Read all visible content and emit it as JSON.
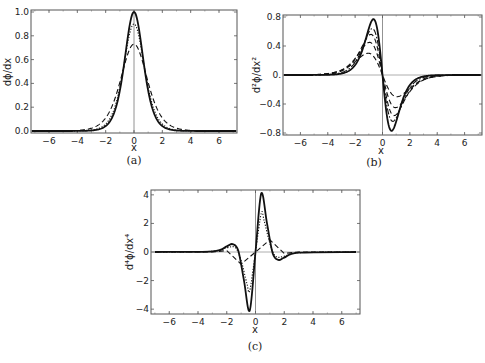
{
  "chart_data": [
    {
      "id": "a",
      "type": "line",
      "caption": "(a)",
      "xlabel": "x",
      "ylabel": "dϕ/dx",
      "xlim": [
        -7.2,
        7.2
      ],
      "ylim": [
        0,
        1.0
      ],
      "xticks": [
        "-6",
        "-4",
        "-2",
        "0",
        "2",
        "4",
        "6"
      ],
      "yticks": [
        "0.0",
        "0.2",
        "0.4",
        "0.6",
        "0.8",
        "1.0"
      ],
      "grid": false,
      "series": [
        {
          "name": "solid",
          "style": "solid",
          "peak": 1.0,
          "x": [
            -7,
            -3,
            -2,
            -1,
            -0.5,
            0,
            0.5,
            1,
            2,
            3,
            7
          ],
          "values": [
            0,
            0.01,
            0.07,
            0.42,
            0.79,
            1.0,
            0.79,
            0.42,
            0.07,
            0.01,
            0
          ]
        },
        {
          "name": "dotted",
          "style": "dotted",
          "peak": 0.9,
          "x": [
            -7,
            -3,
            -2,
            -1,
            -0.5,
            0,
            0.5,
            1,
            2,
            3,
            7
          ],
          "values": [
            0,
            0.01,
            0.08,
            0.43,
            0.74,
            0.9,
            0.74,
            0.43,
            0.08,
            0.01,
            0
          ]
        },
        {
          "name": "dashed",
          "style": "dashed",
          "peak": 0.73,
          "x": [
            -7,
            -3,
            -2,
            -1,
            0,
            1,
            2,
            3,
            7
          ],
          "values": [
            0,
            0.03,
            0.17,
            0.48,
            0.73,
            0.48,
            0.17,
            0.03,
            0
          ]
        }
      ]
    },
    {
      "id": "b",
      "type": "line",
      "caption": "(b)",
      "xlabel": "x",
      "ylabel": "d²ϕ/dx²",
      "xlim": [
        -7.2,
        7.2
      ],
      "ylim": [
        -0.8,
        0.8
      ],
      "xticks": [
        "-6",
        "-4",
        "-2",
        "0",
        "2",
        "4",
        "6"
      ],
      "yticks": [
        "-0.8",
        "-0.4",
        "0.",
        "0.4",
        "0.8"
      ],
      "grid": false,
      "series": [
        {
          "name": "solid",
          "style": "solid",
          "extremum": 0.77,
          "x_extremum": 0.66
        },
        {
          "name": "dot-dashed-1",
          "style": "dashdot",
          "extremum": 0.64,
          "x_extremum": 0.75
        },
        {
          "name": "dashed-1",
          "style": "dashed",
          "extremum": 0.56,
          "x_extremum": 0.85
        },
        {
          "name": "dashed-2",
          "style": "dashed",
          "extremum": 0.45,
          "x_extremum": 0.95
        },
        {
          "name": "dashed-3",
          "style": "dashed",
          "extremum": 0.3,
          "x_extremum": 1.05
        }
      ]
    },
    {
      "id": "c",
      "type": "line",
      "caption": "(c)",
      "xlabel": "x",
      "ylabel": "d⁴ϕ/dx⁴",
      "xlim": [
        -7.2,
        7.2
      ],
      "ylim": [
        -4.2,
        4.2
      ],
      "xticks": [
        "-6",
        "-4",
        "-2",
        "0",
        "2",
        "4",
        "6"
      ],
      "yticks": [
        "-4",
        "-2",
        "0",
        "2",
        "4"
      ],
      "grid": false,
      "series": [
        {
          "name": "solid",
          "style": "solid",
          "x": [
            -7,
            -3,
            -2,
            -1.6,
            -1.2,
            -0.8,
            -0.4,
            0,
            0.4,
            0.8,
            1.2,
            1.6,
            2,
            3,
            7
          ],
          "values": [
            0,
            0.05,
            0.4,
            0.55,
            0.1,
            -2.0,
            -4.1,
            0,
            4.1,
            2.0,
            -0.1,
            -0.55,
            -0.4,
            -0.05,
            0
          ]
        },
        {
          "name": "dotted",
          "style": "dotted",
          "x": [
            -7,
            -3,
            -2,
            -1.4,
            -1,
            -0.6,
            -0.4,
            0,
            0.4,
            0.6,
            1,
            1.4,
            2,
            3,
            7
          ],
          "values": [
            0,
            0.05,
            0.3,
            0.3,
            -0.6,
            -2.2,
            -2.7,
            0,
            2.7,
            2.2,
            0.6,
            -0.3,
            -0.3,
            -0.05,
            0
          ]
        },
        {
          "name": "dashed",
          "style": "dashed",
          "x": [
            -7,
            -3,
            -2,
            -1,
            0,
            1,
            2,
            3,
            7
          ],
          "values": [
            0,
            0,
            0.1,
            -0.85,
            0,
            0.85,
            -0.1,
            0,
            0
          ]
        }
      ]
    }
  ]
}
